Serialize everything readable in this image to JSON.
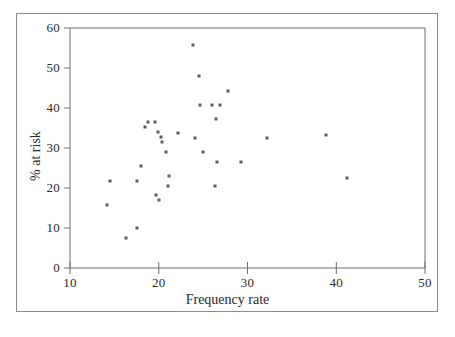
{
  "figure": {
    "background_color": "#ffffff",
    "frame_color": "#8a8a8a",
    "axis_color": "#6e6e6e",
    "marker_color": "#5c5c5c"
  },
  "chart_data": {
    "type": "scatter",
    "title": "",
    "xlabel": "Frequency rate",
    "ylabel": "% at risk",
    "xlim": [
      10,
      50
    ],
    "ylim": [
      0,
      60
    ],
    "xticks": [
      10,
      20,
      30,
      40,
      50
    ],
    "yticks": [
      0,
      10,
      20,
      30,
      40,
      50,
      60
    ],
    "xtick_labels": [
      "10",
      "20",
      "30",
      "40",
      "50"
    ],
    "ytick_labels": [
      "0",
      "10",
      "20",
      "30",
      "40",
      "50",
      "60"
    ],
    "grid": false,
    "legend": null,
    "series": [
      {
        "name": "sites",
        "marker": "square",
        "points": [
          [
            14.2,
            15.8
          ],
          [
            14.5,
            21.8
          ],
          [
            16.3,
            7.5
          ],
          [
            17.5,
            9.9
          ],
          [
            17.6,
            21.8
          ],
          [
            18.0,
            25.5
          ],
          [
            18.4,
            35.2
          ],
          [
            18.8,
            36.5
          ],
          [
            19.6,
            36.4
          ],
          [
            19.7,
            18.2
          ],
          [
            19.9,
            33.9
          ],
          [
            20.0,
            16.9
          ],
          [
            20.2,
            32.8
          ],
          [
            20.4,
            31.5
          ],
          [
            20.8,
            29.0
          ],
          [
            21.0,
            20.5
          ],
          [
            21.2,
            23.0
          ],
          [
            22.2,
            33.8
          ],
          [
            23.9,
            55.8
          ],
          [
            24.1,
            32.5
          ],
          [
            24.5,
            48.0
          ],
          [
            24.6,
            40.8
          ],
          [
            25.0,
            29.0
          ],
          [
            26.0,
            40.8
          ],
          [
            26.3,
            20.5
          ],
          [
            26.5,
            37.2
          ],
          [
            26.6,
            26.5
          ],
          [
            26.9,
            40.8
          ],
          [
            27.8,
            44.2
          ],
          [
            29.3,
            26.5
          ],
          [
            32.2,
            32.5
          ],
          [
            38.9,
            33.2
          ],
          [
            41.2,
            22.5
          ]
        ]
      }
    ]
  }
}
